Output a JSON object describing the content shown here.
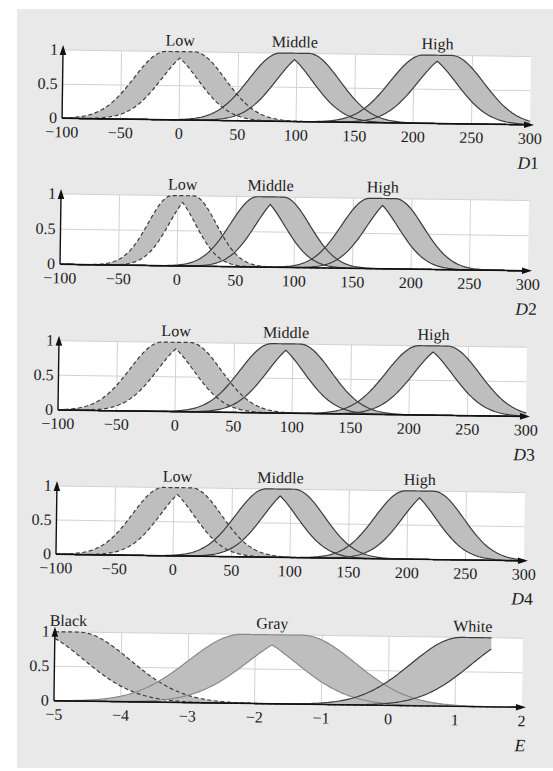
{
  "figure": {
    "panel_background": "#e9e9e9"
  },
  "chart_data": [
    {
      "type": "area",
      "title": "",
      "xlabel": "D1",
      "xlabel_var": "D",
      "xlabel_sub": "1",
      "ylabel": "",
      "xlim": [
        -100,
        300
      ],
      "ylim": [
        0,
        1
      ],
      "xticks": [
        -100,
        -50,
        0,
        50,
        100,
        150,
        200,
        250,
        300
      ],
      "xtick_labels": [
        "−100",
        "−50",
        "0",
        "50",
        "100",
        "150",
        "200",
        "250",
        "300"
      ],
      "yticks": [
        0,
        0.5,
        1
      ],
      "ytick_labels": [
        "0",
        "0.5",
        "1"
      ],
      "grid": true,
      "legend": "none",
      "band_fill": "#bebebe",
      "line_color": "#3c3c3c",
      "series": [
        {
          "name": "Low",
          "mf": "interval type-2 Gaussian, uncertain mean",
          "mean_range": [
            -12,
            12
          ],
          "sigma": 27,
          "line_style": "dashed"
        },
        {
          "name": "Middle",
          "mf": "interval type-2 Gaussian, uncertain mean",
          "mean_range": [
            86,
            110
          ],
          "sigma": 27,
          "line_style": "solid"
        },
        {
          "name": "High",
          "mf": "interval type-2 Gaussian, uncertain mean",
          "mean_range": [
            208,
            232
          ],
          "sigma": 28,
          "line_style": "solid"
        }
      ]
    },
    {
      "type": "area",
      "title": "",
      "xlabel": "D2",
      "xlabel_var": "D",
      "xlabel_sub": "2",
      "ylabel": "",
      "xlim": [
        -100,
        300
      ],
      "ylim": [
        0,
        1
      ],
      "xticks": [
        -100,
        -50,
        0,
        50,
        100,
        150,
        200,
        250,
        300
      ],
      "xtick_labels": [
        "−100",
        "−50",
        "0",
        "50",
        "100",
        "150",
        "200",
        "250",
        "300"
      ],
      "yticks": [
        0,
        0.5,
        1
      ],
      "ytick_labels": [
        "0",
        "0.5",
        "1"
      ],
      "grid": true,
      "legend": "none",
      "band_fill": "#bebebe",
      "line_color": "#3c3c3c",
      "series": [
        {
          "name": "Low",
          "mf": "interval type-2 Gaussian, uncertain mean",
          "mean_range": [
            -5,
            13
          ],
          "sigma": 20,
          "line_style": "dashed"
        },
        {
          "name": "Middle",
          "mf": "interval type-2 Gaussian, uncertain mean",
          "mean_range": [
            68,
            90
          ],
          "sigma": 23,
          "line_style": "solid"
        },
        {
          "name": "High",
          "mf": "interval type-2 Gaussian, uncertain mean",
          "mean_range": [
            164,
            186
          ],
          "sigma": 24,
          "line_style": "solid"
        }
      ]
    },
    {
      "type": "area",
      "title": "",
      "xlabel": "D3",
      "xlabel_var": "D",
      "xlabel_sub": "3",
      "ylabel": "",
      "xlim": [
        -100,
        300
      ],
      "ylim": [
        0,
        1
      ],
      "xticks": [
        -100,
        -50,
        0,
        50,
        100,
        150,
        200,
        250,
        300
      ],
      "xtick_labels": [
        "−100",
        "−50",
        "0",
        "50",
        "100",
        "150",
        "200",
        "250",
        "300"
      ],
      "yticks": [
        0,
        0.5,
        1
      ],
      "ytick_labels": [
        "0",
        "0.5",
        "1"
      ],
      "grid": true,
      "legend": "none",
      "band_fill": "#bebebe",
      "line_color": "#3c3c3c",
      "series": [
        {
          "name": "Low",
          "mf": "interval type-2 Gaussian, uncertain mean",
          "mean_range": [
            -12,
            12
          ],
          "sigma": 27,
          "line_style": "dashed"
        },
        {
          "name": "Middle",
          "mf": "interval type-2 Gaussian, uncertain mean",
          "mean_range": [
            82,
            106
          ],
          "sigma": 27,
          "line_style": "solid"
        },
        {
          "name": "High",
          "mf": "interval type-2 Gaussian, uncertain mean",
          "mean_range": [
            208,
            232
          ],
          "sigma": 28,
          "line_style": "solid"
        }
      ]
    },
    {
      "type": "area",
      "title": "",
      "xlabel": "D4",
      "xlabel_var": "D",
      "xlabel_sub": "4",
      "ylabel": "",
      "xlim": [
        -100,
        300
      ],
      "ylim": [
        0,
        1
      ],
      "xticks": [
        -100,
        -50,
        0,
        50,
        100,
        150,
        200,
        250,
        300
      ],
      "xtick_labels": [
        "−100",
        "−50",
        "0",
        "50",
        "100",
        "150",
        "200",
        "250",
        "300"
      ],
      "yticks": [
        0,
        0.5,
        1
      ],
      "ytick_labels": [
        "0",
        "0.5",
        "1"
      ],
      "grid": true,
      "legend": "none",
      "band_fill": "#bebebe",
      "line_color": "#3c3c3c",
      "series": [
        {
          "name": "Low",
          "mf": "interval type-2 Gaussian, uncertain mean",
          "mean_range": [
            -9,
            15
          ],
          "sigma": 26,
          "line_style": "dashed"
        },
        {
          "name": "Middle",
          "mf": "interval type-2 Gaussian, uncertain mean",
          "mean_range": [
            79,
            103
          ],
          "sigma": 26,
          "line_style": "solid"
        },
        {
          "name": "High",
          "mf": "interval type-2 Gaussian, uncertain mean",
          "mean_range": [
            198,
            222
          ],
          "sigma": 26,
          "line_style": "solid"
        }
      ]
    },
    {
      "type": "area",
      "title": "",
      "xlabel": "E",
      "xlabel_var": "E",
      "xlabel_sub": "",
      "ylabel": "",
      "xlim": [
        -5,
        2
      ],
      "ylim": [
        0,
        1
      ],
      "xticks": [
        -5,
        -4,
        -3,
        -2,
        -1,
        0,
        1,
        2
      ],
      "xtick_labels": [
        "−5",
        "−4",
        "−3",
        "−2",
        "−1",
        "0",
        "1",
        "2"
      ],
      "yticks": [
        0,
        0.5,
        1
      ],
      "ytick_labels": [
        "0",
        "0.5",
        "1"
      ],
      "grid": true,
      "legend": "none",
      "band_fill": "#bebebe",
      "line_color": "#3c3c3c",
      "series": [
        {
          "name": "Black",
          "mf": "interval type-2 Gaussian, uncertain mean (left shoulder)",
          "mean_range": [
            -5.35,
            -4.65
          ],
          "sigma": 0.78,
          "line_style": "dashed",
          "label_x": -4.8
        },
        {
          "name": "Gray",
          "mf": "interval type-2 Gaussian, uncertain mean",
          "mean_range": [
            -2.2,
            -1.3
          ],
          "sigma": 0.8,
          "line_style": "solid",
          "line_color": "#8a8a8a"
        },
        {
          "name": "White",
          "mf": "interval type-2 Gaussian, uncertain mean (truncated)",
          "mean_range": [
            1.08,
            1.98
          ],
          "sigma": 0.75,
          "line_style": "solid",
          "domain": [
            -5,
            1.53
          ],
          "label_x": 1.25
        }
      ]
    }
  ]
}
